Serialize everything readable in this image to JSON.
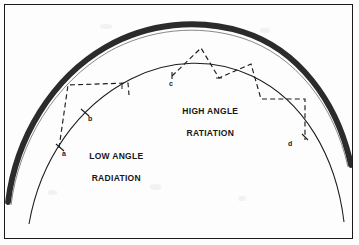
{
  "figure": {
    "background_color": "#fdfdfd",
    "frame_color": "#1a1a1a",
    "ink_color": "#1c1c1c",
    "ionosphere_band_color": "#2b2b2b"
  },
  "annotations": {
    "high_angle": {
      "line1": "HIGH ANGLE",
      "line2": "RATIATION"
    },
    "low_angle": {
      "line1": "LOW ANGLE",
      "line2": "RADIATION"
    }
  },
  "point_labels": [
    {
      "id": "a",
      "text": "a"
    },
    {
      "id": "b",
      "text": "b"
    },
    {
      "id": "c",
      "text": "c"
    },
    {
      "id": "d",
      "text": "d"
    }
  ],
  "geometry": {
    "earth_arc": {
      "description": "thin solid arc representing the earth surface",
      "center_x": 180,
      "center_y": 260,
      "radius": 188,
      "stroke_width": 1.0
    },
    "ionosphere_band": {
      "description": "thick dark band representing the ionospheric reflecting layer",
      "center_x": 180,
      "center_y": 268,
      "radius_inner": 228,
      "radius_outer": 236,
      "stroke_width": 5.5
    },
    "low_angle_ray": {
      "description": "shallow take-off angle ray, one long hop",
      "dashed": true,
      "points": "a to ionosphere to b"
    },
    "high_angle_ray": {
      "description": "steep take-off angle ray, multiple short hops",
      "dashed": true,
      "points": "c to ionosphere apex to ground to ionosphere to d"
    }
  }
}
